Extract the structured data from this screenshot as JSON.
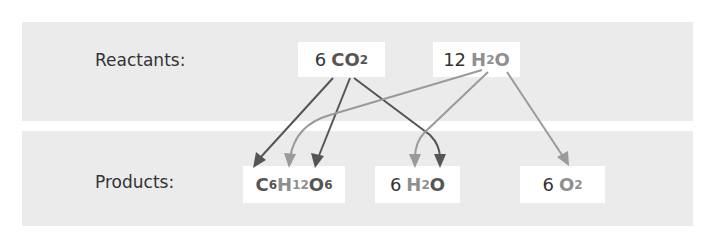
{
  "diagram": {
    "colors": {
      "panel_bg": "#ebebeb",
      "box_bg": "#ffffff",
      "text": "#333333",
      "carbon_dioxide_atoms": "#555555",
      "water_atoms": "#8f8f8f"
    },
    "reactants": {
      "label": "Reactants:",
      "molecules": [
        {
          "id": "co2",
          "coefficient": "6",
          "parts": [
            {
              "symbol": "C",
              "sub": "",
              "shade": "dark"
            },
            {
              "symbol": "O",
              "sub": "2",
              "shade": "dark"
            }
          ]
        },
        {
          "id": "h2o",
          "coefficient": "12",
          "parts": [
            {
              "symbol": "H",
              "sub": "2",
              "shade": "light"
            },
            {
              "symbol": "O",
              "sub": "",
              "shade": "light"
            }
          ]
        }
      ]
    },
    "products": {
      "label": "Products:",
      "molecules": [
        {
          "id": "glucose",
          "coefficient": "",
          "parts": [
            {
              "symbol": "C",
              "sub": "6",
              "shade": "dark"
            },
            {
              "symbol": "H",
              "sub": "12",
              "shade": "light"
            },
            {
              "symbol": "O",
              "sub": "6",
              "shade": "dark"
            }
          ]
        },
        {
          "id": "water",
          "coefficient": "6",
          "parts": [
            {
              "symbol": "H",
              "sub": "2",
              "shade": "light"
            },
            {
              "symbol": "O",
              "sub": "",
              "shade": "dark"
            }
          ]
        },
        {
          "id": "oxygen",
          "coefficient": "6",
          "parts": [
            {
              "symbol": "O",
              "sub": "2",
              "shade": "light"
            }
          ]
        }
      ]
    },
    "arrows": [
      {
        "from": "CO2 (C)",
        "to": "C6H12O6 (C)",
        "shade": "dark"
      },
      {
        "from": "CO2 (O)",
        "to": "C6H12O6 (O)",
        "shade": "dark"
      },
      {
        "from": "CO2 (O)",
        "to": "H2O (O)",
        "shade": "dark"
      },
      {
        "from": "H2O (H)",
        "to": "C6H12O6 (H)",
        "shade": "light"
      },
      {
        "from": "H2O (H)",
        "to": "H2O (H)",
        "shade": "light"
      },
      {
        "from": "H2O (O)",
        "to": "O2 (O)",
        "shade": "light"
      }
    ]
  }
}
